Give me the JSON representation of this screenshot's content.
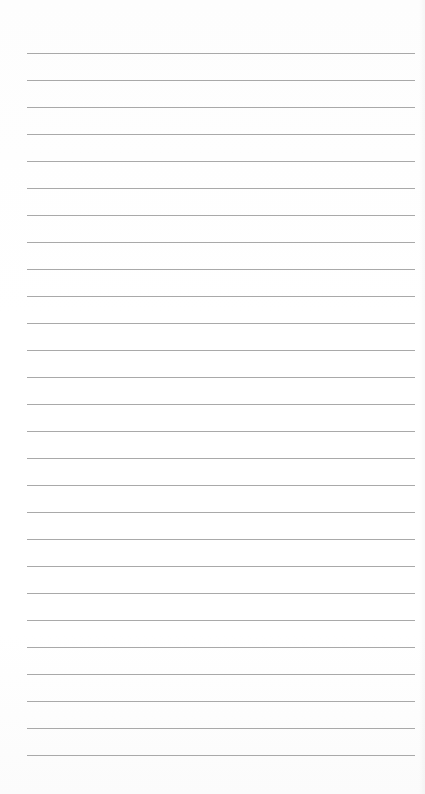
{
  "page": {
    "type": "ruled-notepad-sheet",
    "background_color": "#ffffff",
    "line_color": "#9a9a9a",
    "line_count": 27,
    "first_line_y": 53,
    "line_spacing": 27,
    "line_left": 27,
    "line_right": 415
  }
}
